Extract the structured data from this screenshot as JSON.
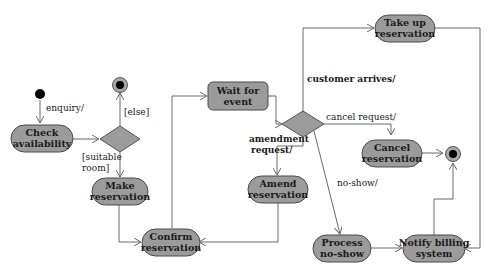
{
  "diagram": {
    "type": "UML activity diagram",
    "colors": {
      "activity_fill": "#9b9b9b",
      "stroke": "#4a4a4a",
      "edge": "#6a6a6a",
      "initial_node": "#000000",
      "background": "#ffffff"
    },
    "nodes": {
      "check_availability": {
        "line1": "Check",
        "line2": "availability"
      },
      "make_reservation": {
        "line1": "Make",
        "line2": "reservation"
      },
      "confirm_reservation": {
        "line1": "Confirm",
        "line2": "reservation"
      },
      "wait_for_event": {
        "line1": "Wait for",
        "line2": "event"
      },
      "take_up_reservation": {
        "line1": "Take up",
        "line2": "reservation"
      },
      "amend_reservation": {
        "line1": "Amend",
        "line2": "reservation"
      },
      "cancel_reservation": {
        "line1": "Cancel",
        "line2": "reservation"
      },
      "process_no_show": {
        "line1": "Process",
        "line2": "no-show"
      },
      "notify_billing": {
        "line1": "Notify billing",
        "line2": "system"
      }
    },
    "edges": {
      "enquiry": "enquiry/",
      "else": "[else]",
      "suitable_room_1": "[suitable",
      "suitable_room_2": "room]",
      "customer_arrives": "customer arrives/",
      "cancel_request": "cancel request/",
      "amendment_request_1": "amendment",
      "amendment_request_2": "request/",
      "no_show": "no-show/"
    }
  }
}
